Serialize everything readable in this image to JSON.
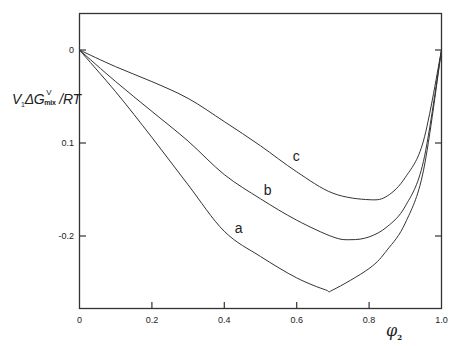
{
  "chart_data": {
    "type": "line",
    "title": "",
    "xlabel": "φ₂",
    "ylabel": "V₁ΔG^V_mix/RT",
    "ylabel_parts": {
      "v": "V",
      "v_sub": "1",
      "dg": "ΔG",
      "sup": "V",
      "sub": "mix",
      "rest": "/RT"
    },
    "xlabel_parts": {
      "symbol": "φ",
      "sub": "2"
    },
    "xlim": [
      0,
      1.0
    ],
    "ylim": [
      -0.28,
      0.04
    ],
    "grid": false,
    "legend": "inline curve labels",
    "x_ticks": [
      0,
      0.2,
      0.4,
      0.6,
      0.8,
      1.0
    ],
    "x_tick_labels": [
      "0",
      "0.2",
      "0.4",
      "0.6",
      "0.8",
      "1.0"
    ],
    "y_ticks": [
      0,
      -0.1,
      -0.2
    ],
    "y_tick_labels": [
      "0",
      "0.1",
      "-0.2"
    ],
    "series": [
      {
        "name": "a",
        "x": [
          0,
          0.1,
          0.2,
          0.3,
          0.4,
          0.5,
          0.6,
          0.68,
          0.7,
          0.8,
          0.85,
          0.9,
          0.95,
          1.0
        ],
        "values": [
          0,
          -0.045,
          -0.094,
          -0.145,
          -0.195,
          -0.222,
          -0.245,
          -0.258,
          -0.258,
          -0.235,
          -0.215,
          -0.186,
          -0.13,
          0
        ],
        "label_pos": [
          0.44,
          -0.192
        ]
      },
      {
        "name": "b",
        "x": [
          0,
          0.1,
          0.2,
          0.3,
          0.4,
          0.5,
          0.6,
          0.7,
          0.75,
          0.8,
          0.85,
          0.9,
          0.95,
          1.0
        ],
        "values": [
          0,
          -0.034,
          -0.066,
          -0.098,
          -0.134,
          -0.16,
          -0.183,
          -0.201,
          -0.204,
          -0.201,
          -0.19,
          -0.168,
          -0.12,
          0
        ],
        "label_pos": [
          0.52,
          -0.152
        ]
      },
      {
        "name": "c",
        "x": [
          0,
          0.1,
          0.2,
          0.3,
          0.4,
          0.5,
          0.6,
          0.7,
          0.8,
          0.85,
          0.9,
          0.95,
          1.0
        ],
        "values": [
          0,
          -0.018,
          -0.034,
          -0.052,
          -0.077,
          -0.103,
          -0.131,
          -0.154,
          -0.161,
          -0.157,
          -0.137,
          -0.098,
          0
        ],
        "label_pos": [
          0.6,
          -0.115
        ]
      }
    ]
  }
}
